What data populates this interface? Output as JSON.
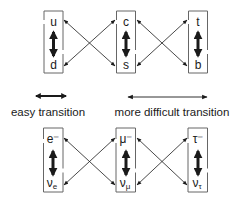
{
  "quarks": {
    "columns": [
      {
        "top": "u",
        "bottom": "d"
      },
      {
        "top": "c",
        "bottom": "s"
      },
      {
        "top": "t",
        "bottom": "b"
      }
    ]
  },
  "leptons": {
    "columns": [
      {
        "top": "e⁻",
        "bottom": "ν",
        "bottom_sub": "e"
      },
      {
        "top": "μ⁻",
        "bottom": "ν",
        "bottom_sub": "μ"
      },
      {
        "top": "τ⁻",
        "bottom": "ν",
        "bottom_sub": "τ"
      }
    ]
  },
  "legend": {
    "easy_label": "easy transition",
    "difficult_label": "more difficult transition"
  },
  "colors": {
    "line": "#1a1a1a",
    "box": "#555555"
  }
}
